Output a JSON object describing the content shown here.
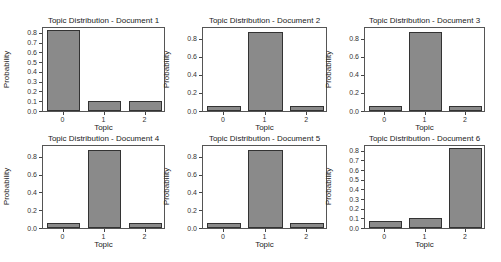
{
  "chart_data": [
    {
      "type": "bar",
      "title": "Topic Distribution - Document 1",
      "xlabel": "Topic",
      "ylabel": "Probability",
      "categories": [
        "0",
        "1",
        "2"
      ],
      "values": [
        0.83,
        0.1,
        0.1
      ],
      "ylim": [
        0,
        0.85
      ],
      "yticks": [
        "0.0",
        "0.1",
        "0.2",
        "0.3",
        "0.4",
        "0.5",
        "0.6",
        "0.7",
        "0.8"
      ],
      "grid": false
    },
    {
      "type": "bar",
      "title": "Topic Distribution - Document 2",
      "xlabel": "Topic",
      "ylabel": "Probability",
      "categories": [
        "0",
        "1",
        "2"
      ],
      "values": [
        0.06,
        0.88,
        0.06
      ],
      "ylim": [
        0,
        0.92
      ],
      "yticks": [
        "0.0",
        "0.2",
        "0.4",
        "0.6",
        "0.8"
      ],
      "grid": false
    },
    {
      "type": "bar",
      "title": "Topic Distribution - Document 3",
      "xlabel": "Topic",
      "ylabel": "Probability",
      "categories": [
        "0",
        "1",
        "2"
      ],
      "values": [
        0.06,
        0.88,
        0.06
      ],
      "ylim": [
        0,
        0.92
      ],
      "yticks": [
        "0.0",
        "0.2",
        "0.4",
        "0.6",
        "0.8"
      ],
      "grid": false
    },
    {
      "type": "bar",
      "title": "Topic Distribution - Document 4",
      "xlabel": "Topic",
      "ylabel": "Probability",
      "categories": [
        "0",
        "1",
        "2"
      ],
      "values": [
        0.06,
        0.88,
        0.06
      ],
      "ylim": [
        0,
        0.92
      ],
      "yticks": [
        "0.0",
        "0.2",
        "0.4",
        "0.6",
        "0.8"
      ],
      "grid": false
    },
    {
      "type": "bar",
      "title": "Topic Distribution - Document 5",
      "xlabel": "Topic",
      "ylabel": "Probability",
      "categories": [
        "0",
        "1",
        "2"
      ],
      "values": [
        0.06,
        0.87,
        0.06
      ],
      "ylim": [
        0,
        0.92
      ],
      "yticks": [
        "0.0",
        "0.2",
        "0.4",
        "0.6",
        "0.8"
      ],
      "grid": false
    },
    {
      "type": "bar",
      "title": "Topic Distribution - Document 6",
      "xlabel": "Topic",
      "ylabel": "Probability",
      "categories": [
        "0",
        "1",
        "2"
      ],
      "values": [
        0.07,
        0.1,
        0.83
      ],
      "ylim": [
        0,
        0.85
      ],
      "yticks": [
        "0.0",
        "0.1",
        "0.2",
        "0.3",
        "0.4",
        "0.5",
        "0.6",
        "0.7",
        "0.8"
      ],
      "grid": false
    }
  ],
  "colors": {
    "bar": "#8a8a8a",
    "bar_edge": "#333333",
    "axis": "#555555"
  }
}
